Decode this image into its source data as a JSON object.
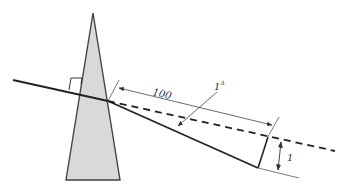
{
  "diagram": {
    "labels": {
      "distance": "100",
      "prism_unit": "1",
      "prism_symbol": "Δ",
      "displacement": "1"
    },
    "colors": {
      "prism_fill": "#d9d9d9",
      "prism_stroke": "#444444",
      "ray": "#2a2a2a",
      "dimension": "#555555",
      "background": "#ffffff"
    },
    "elements": [
      "prism",
      "incident-ray",
      "right-angle-marker",
      "deviated-ray",
      "undeviated-dashed-ray",
      "distance-dimension",
      "prism-diopter-leader",
      "displacement-dimension"
    ]
  }
}
